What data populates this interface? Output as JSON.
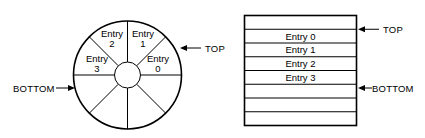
{
  "figure": {
    "title": "",
    "type": "circular-and-linear-buffer-diagram"
  },
  "circular_buffer": {
    "name": "circular-ring-buffer",
    "sector_count": 8,
    "hub_label": "",
    "entries": [
      {
        "label_line1": "Entry",
        "label_line2": "0",
        "sector_index": 0
      },
      {
        "label_line1": "Entry",
        "label_line2": "1",
        "sector_index": 1
      },
      {
        "label_line1": "Entry",
        "label_line2": "2",
        "sector_index": 2
      },
      {
        "label_line1": "Entry",
        "label_line2": "3",
        "sector_index": 3
      }
    ],
    "pointers": [
      {
        "label": "TOP",
        "side": "right"
      },
      {
        "label": "BOTTOM",
        "side": "left"
      }
    ]
  },
  "linear_buffer": {
    "name": "linear-table-buffer",
    "row_count": 8,
    "rows": [
      {
        "label": ""
      },
      {
        "label": "Entry 0"
      },
      {
        "label": "Entry 1"
      },
      {
        "label": "Entry 2"
      },
      {
        "label": "Entry 3"
      },
      {
        "label": ""
      },
      {
        "label": ""
      },
      {
        "label": ""
      }
    ],
    "pointers": [
      {
        "label": "TOP",
        "side": "right",
        "row_boundary": 1
      },
      {
        "label": "BOTTOM",
        "side": "right",
        "row_boundary": 5
      }
    ]
  },
  "colors": {
    "stroke": "#000000",
    "fill": "#ffffff",
    "background": "#ffffff"
  }
}
